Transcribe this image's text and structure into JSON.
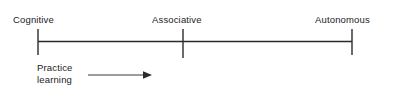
{
  "figure": {
    "type": "timeline-diagram",
    "background_color": "#ffffff",
    "line_color": "#2b2b2b",
    "text_color": "#1c1c1c"
  },
  "axis": {
    "orientation": "horizontal",
    "start_x": 38,
    "end_x": 352,
    "y": 41.5
  },
  "stages": [
    {
      "id": "cognitive",
      "label": "Cognitive",
      "tick_x": 38,
      "tick_top": 29,
      "tick_bottom": 55
    },
    {
      "id": "associative",
      "label": "Associative",
      "tick_x": 183,
      "tick_top": 29,
      "tick_bottom": 58
    },
    {
      "id": "autonomous",
      "label": "Autonomous",
      "tick_x": 352,
      "tick_top": 29,
      "tick_bottom": 55
    }
  ],
  "annotation": {
    "id": "practice-learning",
    "line1": "Practice",
    "line2": "learning",
    "arrow": {
      "name": "rightward-arrow",
      "start_x": 88,
      "end_x": 151,
      "y": 75,
      "direction": "right"
    }
  }
}
